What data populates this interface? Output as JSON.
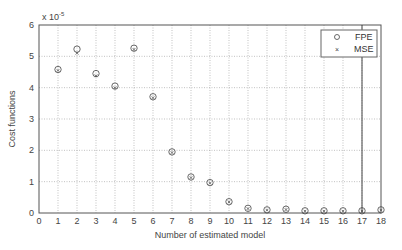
{
  "chart_data": {
    "type": "scatter",
    "title": "",
    "xlabel": "Number of estimated model",
    "ylabel": "Cost functions",
    "y_scale_label": "x 10",
    "y_scale_exponent": "-5",
    "xlim": [
      0,
      18
    ],
    "ylim": [
      0,
      6
    ],
    "xticks": [
      0,
      1,
      2,
      3,
      4,
      5,
      6,
      7,
      8,
      9,
      10,
      11,
      12,
      13,
      14,
      15,
      16,
      17,
      18
    ],
    "yticks": [
      0,
      1,
      2,
      3,
      4,
      5,
      6
    ],
    "grid": true,
    "legend_position": "upper right",
    "x": [
      1,
      2,
      3,
      4,
      5,
      6,
      7,
      8,
      9,
      10,
      11,
      12,
      13,
      14,
      15,
      16,
      17,
      18
    ],
    "series": [
      {
        "name": "FPE",
        "marker": "circle",
        "values": [
          4.58,
          5.23,
          4.45,
          4.05,
          5.26,
          3.71,
          1.95,
          1.15,
          0.97,
          0.36,
          0.15,
          0.1,
          0.12,
          0.07,
          0.07,
          0.07,
          0.07,
          0.1
        ]
      },
      {
        "name": "MSE",
        "marker": "x",
        "values": [
          4.55,
          5.1,
          4.38,
          4.0,
          5.22,
          3.68,
          1.93,
          1.13,
          0.95,
          0.35,
          0.14,
          0.09,
          0.11,
          0.06,
          0.06,
          0.06,
          0.06,
          0.09
        ]
      }
    ],
    "annotations": [
      {
        "type": "vertical-line",
        "x": 17,
        "note": "solid line marking selected model"
      }
    ]
  },
  "legend": {
    "fpe_label": "FPE",
    "mse_label": "MSE"
  }
}
